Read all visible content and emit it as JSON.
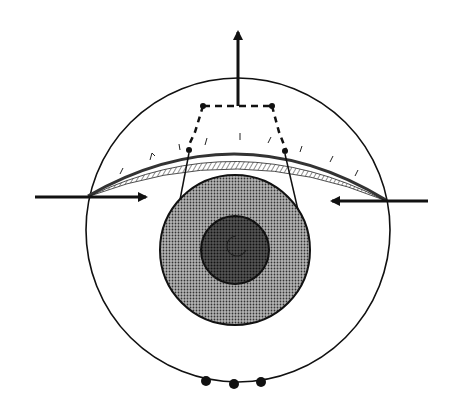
{
  "diagram": {
    "type": "schematic",
    "colors": {
      "background": "#ffffff",
      "line": "#111111",
      "iris_fill": "#8a8a8a",
      "pupil_fill": "#2e2e2e"
    },
    "elements": {
      "globe": {
        "cx": 238,
        "cy": 230,
        "r": 152
      },
      "iris": {
        "cx": 235,
        "cy": 250,
        "r": 75
      },
      "pupil": {
        "cx": 235,
        "cy": 250,
        "r": 34
      },
      "upward_arrow": {
        "x": 238,
        "y_from": 106,
        "y_to": 28
      },
      "left_arrow": {
        "x_from": 35,
        "x_to": 148,
        "y": 197
      },
      "right_arrow": {
        "x_from": 428,
        "x_to": 330,
        "y": 201
      },
      "dots_bottom": [
        {
          "cx": 206,
          "cy": 381
        },
        {
          "cx": 234,
          "cy": 384
        },
        {
          "cx": 261,
          "cy": 382
        }
      ]
    }
  }
}
